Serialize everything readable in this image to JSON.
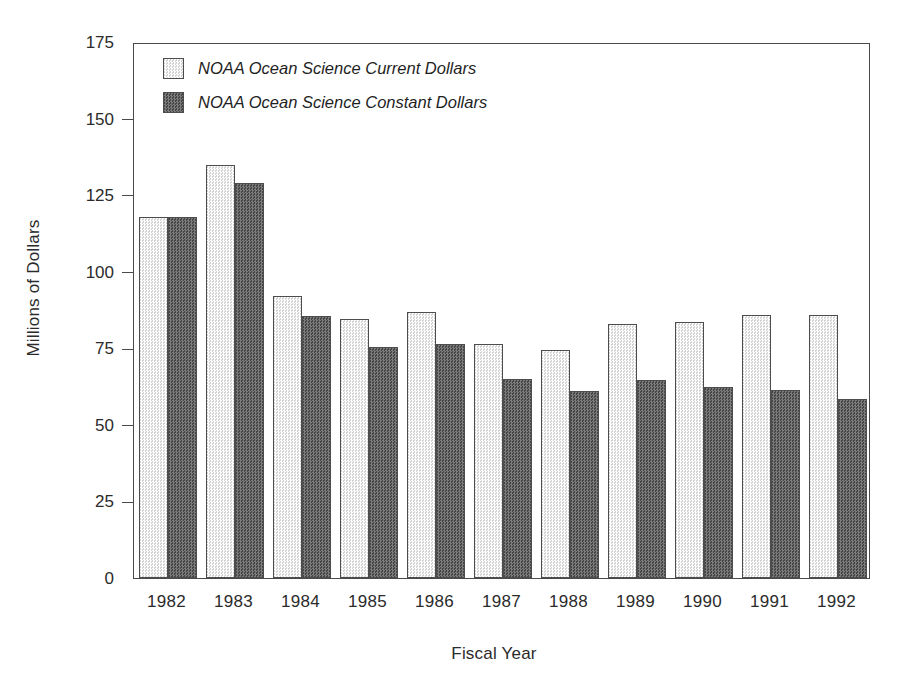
{
  "chart_data": {
    "type": "bar",
    "title": "",
    "xlabel": "Fiscal Year",
    "ylabel": "Millions of Dollars",
    "categories": [
      "1982",
      "1983",
      "1984",
      "1985",
      "1986",
      "1987",
      "1988",
      "1989",
      "1990",
      "1991",
      "1992"
    ],
    "series": [
      {
        "name": "NOAA Ocean Science Current Dollars",
        "key": "current",
        "color": "#e9e9e9",
        "values": [
          118,
          135,
          92,
          84.5,
          87,
          76.5,
          74.5,
          83,
          83.5,
          86,
          86
        ]
      },
      {
        "name": "NOAA Ocean Science Constant  Dollars",
        "key": "constant",
        "color": "#5c5c5c",
        "values": [
          118,
          129,
          85.5,
          75.5,
          76.5,
          65,
          61,
          64.5,
          62.5,
          61.5,
          58.5
        ]
      }
    ],
    "ylim": [
      0,
      175
    ],
    "yticks": [
      0,
      25,
      50,
      75,
      100,
      125,
      150,
      175
    ],
    "ytick_labels": [
      "0",
      "25",
      "50",
      "75",
      "100",
      "125",
      "150",
      "175"
    ],
    "grid": false,
    "legend_position": "top-left"
  },
  "legend": {
    "entries": [
      {
        "label": "NOAA Ocean Science Current Dollars",
        "swatch": "light"
      },
      {
        "label": "NOAA Ocean Science Constant  Dollars",
        "swatch": "dark"
      }
    ]
  }
}
